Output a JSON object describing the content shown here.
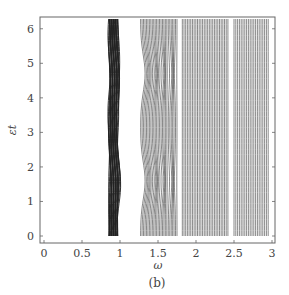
{
  "chart_data": {
    "type": "line",
    "title": "",
    "caption": "(b)",
    "xlabel": "ω",
    "ylabel": "εt",
    "xlim": [
      0,
      3
    ],
    "ylim": [
      0,
      6.283
    ],
    "xticks": [
      "0",
      "0.5",
      "1",
      "1.5",
      "2",
      "2.5",
      "3"
    ],
    "yticks": [
      "0",
      "1",
      "2",
      "3",
      "4",
      "5",
      "6"
    ],
    "grid": false,
    "legend": null,
    "bands": [
      {
        "name": "band-1",
        "omega_left": 0.85,
        "omega_right": 0.97,
        "bulge_right": 1.0,
        "bulge_at": [
          1.6,
          4.7
        ],
        "lines": 30,
        "shade": "dark"
      },
      {
        "name": "band-2",
        "omega_left": 1.27,
        "omega_right": 1.75,
        "bulge_left": 1.33,
        "bulge_at": [
          1.6,
          4.7
        ],
        "lines": 26,
        "shade": "medium"
      },
      {
        "name": "band-3",
        "omega_left": 1.82,
        "omega_right": 2.42,
        "lines": 28,
        "shade": "medium"
      },
      {
        "name": "band-4",
        "omega_left": 2.5,
        "omega_right": 2.95,
        "lines": 20,
        "shade": "medium"
      }
    ]
  }
}
